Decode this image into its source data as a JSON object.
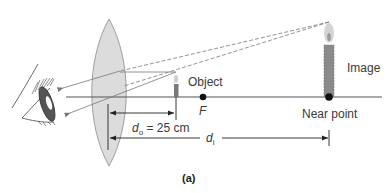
{
  "figure": {
    "caption": "(a)",
    "labels": {
      "object": "Object",
      "image": "Image",
      "focal_point": "F",
      "near_point": "Near point",
      "object_distance_symbol": "d",
      "object_distance_sub": "o",
      "object_distance_value": " = 25 cm",
      "image_distance_symbol": "d",
      "image_distance_sub": "i"
    },
    "colors": {
      "lens_fill": "#dcdcdc",
      "lens_stroke": "#8a8a8a",
      "ray": "#777777",
      "axis": "#555555",
      "candle": "#7a7a7a",
      "flame": "#c8c8c8"
    },
    "elements": [
      "eye",
      "converging-lens",
      "optical-axis",
      "object-candle",
      "image-candle",
      "focal-point",
      "near-point",
      "light-rays",
      "dimension-arrows"
    ]
  }
}
